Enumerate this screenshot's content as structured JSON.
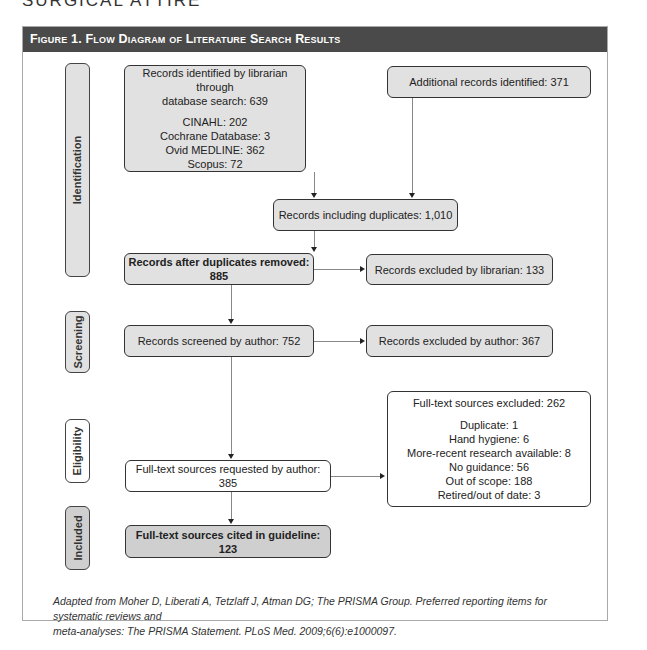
{
  "running_head": "SURGICAL ATTIRE",
  "figure": {
    "title": "Figure 1. Flow Diagram of Literature Search Results",
    "stages": [
      {
        "label": "Identification"
      },
      {
        "label": "Screening"
      },
      {
        "label": "Eligibility"
      },
      {
        "label": "Included"
      }
    ],
    "boxes": {
      "db_search": {
        "title": "Records identified by librarian through database search: 639",
        "title_line1": "Records identified by librarian through",
        "title_line2": "database search: 639",
        "items": [
          "CINAHL: 202",
          "Cochrane Database: 3",
          "Ovid MEDLINE: 362",
          "Scopus: 72"
        ]
      },
      "additional": {
        "label": "Additional records identified: 371"
      },
      "with_duplicates": {
        "label": "Records including duplicates: 1,010"
      },
      "after_duplicates": {
        "label": "Records after duplicates removed: 885"
      },
      "excluded_librarian": {
        "label": "Records excluded by librarian: 133"
      },
      "screened_author": {
        "label": "Records screened by author: 752"
      },
      "excluded_author": {
        "label": "Records excluded by author: 367"
      },
      "fulltext_requested": {
        "label": "Full-text sources requested by author: 385"
      },
      "fulltext_excluded": {
        "title": "Full-text sources excluded: 262",
        "items": [
          "Duplicate: 1",
          "Hand hygiene: 6",
          "More-recent research available: 8",
          "No guidance: 56",
          "Out of scope: 188",
          "Retired/out of date: 3"
        ]
      },
      "cited": {
        "label": "Full-text sources cited in guideline: 123"
      }
    },
    "caption": {
      "line1": "Adapted from Moher D, Liberati A, Tetzlaff J, Atman DG; The PRISMA Group. Preferred reporting items for systematic reviews and",
      "line2": "meta-analyses: The PRISMA Statement. PLoS Med. 2009;6(6):e1000097."
    },
    "colors": {
      "header_bg": "#4a4a4a",
      "box_grey": "#e1e1e1",
      "box_dark": "#cfcfcf",
      "box_white": "#ffffff"
    }
  }
}
